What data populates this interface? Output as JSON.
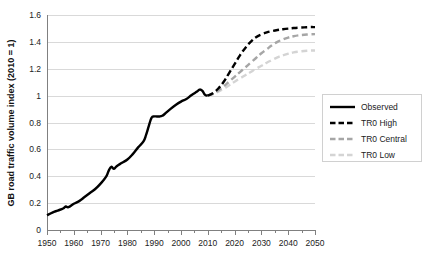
{
  "chart_data": {
    "type": "line",
    "title": "",
    "xlabel": "",
    "ylabel": "GB road traffic volume index (2010 = 1)",
    "xlim": [
      1950,
      2050
    ],
    "ylim": [
      0,
      1.6
    ],
    "grid": true,
    "legend_position": "right",
    "x_tick_labels": [
      "1950",
      "1960",
      "1970",
      "1980",
      "1990",
      "2000",
      "2010",
      "2020",
      "2030",
      "2040",
      "2050"
    ],
    "x_tick_values": [
      1950,
      1960,
      1970,
      1980,
      1990,
      2000,
      2010,
      2020,
      2030,
      2040,
      2050
    ],
    "x_minor_tick_values": [
      1955,
      1965,
      1975,
      1985,
      1995,
      2005,
      2015,
      2025,
      2035,
      2045
    ],
    "y_tick_labels": [
      "0",
      "0.2",
      "0.4",
      "0.6",
      "0.8",
      "1",
      "1.2",
      "1.4",
      "1.6"
    ],
    "y_tick_values": [
      0,
      0.2,
      0.4,
      0.6,
      0.8,
      1,
      1.2,
      1.4,
      1.6
    ],
    "series": [
      {
        "name": "Observed",
        "color": "#000000",
        "style": "solid",
        "width": 2.4,
        "x": [
          1950,
          1952,
          1954,
          1956,
          1957,
          1958,
          1960,
          1962,
          1964,
          1966,
          1968,
          1970,
          1972,
          1973,
          1974,
          1975,
          1976,
          1978,
          1980,
          1982,
          1984,
          1986,
          1987,
          1988,
          1989,
          1990,
          1991,
          1992,
          1993,
          1994,
          1996,
          1998,
          2000,
          2002,
          2004,
          2006,
          2007,
          2008,
          2009,
          2010
        ],
        "y": [
          0.11,
          0.13,
          0.145,
          0.16,
          0.175,
          0.17,
          0.195,
          0.215,
          0.245,
          0.275,
          0.305,
          0.345,
          0.395,
          0.44,
          0.47,
          0.455,
          0.475,
          0.5,
          0.525,
          0.565,
          0.615,
          0.66,
          0.71,
          0.775,
          0.835,
          0.845,
          0.845,
          0.845,
          0.85,
          0.865,
          0.9,
          0.93,
          0.955,
          0.975,
          1.005,
          1.03,
          1.045,
          1.035,
          1.005,
          1.0
        ]
      },
      {
        "name": "TR0 High",
        "color": "#000000",
        "style": "dashed",
        "width": 2.4,
        "x": [
          2010,
          2012,
          2014,
          2016,
          2018,
          2020,
          2022,
          2024,
          2026,
          2028,
          2030,
          2032,
          2034,
          2036,
          2038,
          2040,
          2042,
          2044,
          2046,
          2048,
          2050
        ],
        "y": [
          1.0,
          1.02,
          1.055,
          1.105,
          1.17,
          1.235,
          1.3,
          1.355,
          1.4,
          1.435,
          1.455,
          1.47,
          1.48,
          1.488,
          1.494,
          1.499,
          1.503,
          1.506,
          1.508,
          1.51,
          1.51
        ]
      },
      {
        "name": "TR0 Central",
        "color": "#a6a6a6",
        "style": "dashed",
        "width": 2.4,
        "x": [
          2010,
          2012,
          2014,
          2016,
          2018,
          2020,
          2022,
          2024,
          2026,
          2028,
          2030,
          2032,
          2034,
          2036,
          2038,
          2040,
          2042,
          2044,
          2046,
          2048,
          2050
        ],
        "y": [
          1.0,
          1.015,
          1.04,
          1.07,
          1.105,
          1.14,
          1.175,
          1.21,
          1.245,
          1.28,
          1.315,
          1.345,
          1.375,
          1.4,
          1.418,
          1.432,
          1.442,
          1.449,
          1.453,
          1.456,
          1.458
        ]
      },
      {
        "name": "TR0 Low",
        "color": "#d4d4d4",
        "style": "dashed",
        "width": 2.4,
        "x": [
          2010,
          2012,
          2014,
          2016,
          2018,
          2020,
          2022,
          2024,
          2026,
          2028,
          2030,
          2032,
          2034,
          2036,
          2038,
          2040,
          2042,
          2044,
          2046,
          2048,
          2050
        ],
        "y": [
          1.0,
          1.012,
          1.03,
          1.052,
          1.078,
          1.103,
          1.128,
          1.152,
          1.176,
          1.2,
          1.222,
          1.245,
          1.265,
          1.285,
          1.3,
          1.312,
          1.322,
          1.328,
          1.332,
          1.335,
          1.336
        ]
      }
    ]
  },
  "legend": {
    "items": [
      {
        "label": "Observed",
        "color": "#000000",
        "style": "solid"
      },
      {
        "label": "TR0 High",
        "color": "#000000",
        "style": "dashed"
      },
      {
        "label": "TR0 Central",
        "color": "#a6a6a6",
        "style": "dashed"
      },
      {
        "label": "TR0 Low",
        "color": "#d4d4d4",
        "style": "dashed"
      }
    ]
  },
  "colors": {
    "gridline": "#d9d9d9",
    "axis": "#808080",
    "text": "#222222",
    "background": "#ffffff"
  }
}
